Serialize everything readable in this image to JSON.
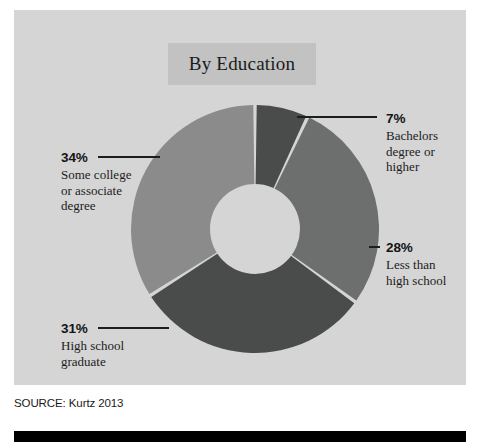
{
  "figure": {
    "title": "By Education",
    "source": "SOURCE: Kurtz 2013"
  },
  "colors": {
    "panel_background": "#d4d5d4",
    "title_band": "#c1c2c1",
    "slice_dark": "#4a4b4b",
    "slice_medium": "#6d6e6e",
    "slice_light": "#8a8b8a",
    "hole": "#d4d5d4",
    "separator": "#d4d5d4",
    "text": "#1a1a1a",
    "bottom_bar": "#000000"
  },
  "labels": {
    "bachelors": {
      "pct": "7%",
      "desc": "Bachelors\ndegree or\nhigher"
    },
    "less_than_high_school": {
      "pct": "28%",
      "desc": "Less than\nhigh school"
    },
    "some_college": {
      "pct": "34%",
      "desc": "Some college\nor associate\ndegree"
    },
    "high_school": {
      "pct": "31%",
      "desc": "High school\ngraduate"
    }
  },
  "chart_data": {
    "type": "pie",
    "title": "By Education",
    "subtitle": "",
    "xlabel": "",
    "ylabel": "",
    "donut": true,
    "hole_ratio": 0.36,
    "start_angle_deg": 0,
    "direction": "clockwise",
    "legend_position": "callout-labels",
    "grid": false,
    "value_unit": "percent",
    "source": "SOURCE: Kurtz 2013",
    "categories": [
      "Bachelors degree or higher",
      "Less than high school",
      "High school graduate",
      "Some college or associate degree"
    ],
    "values": [
      7,
      28,
      31,
      34
    ],
    "labels": [
      "7%",
      "28%",
      "31%",
      "34%"
    ],
    "slice_colors": [
      "#4a4b4b",
      "#6d6e6e",
      "#4a4b4b",
      "#8a8b8a"
    ],
    "slices": [
      {
        "label": "Bachelors degree or higher",
        "value": 7,
        "display": "7%",
        "color": "#4a4b4b"
      },
      {
        "label": "Less than high school",
        "value": 28,
        "display": "28%",
        "color": "#6d6e6e"
      },
      {
        "label": "High school graduate",
        "value": 31,
        "display": "31%",
        "color": "#4a4b4b"
      },
      {
        "label": "Some college or associate degree",
        "value": 34,
        "display": "34%",
        "color": "#8a8b8a"
      }
    ],
    "total": 100
  }
}
